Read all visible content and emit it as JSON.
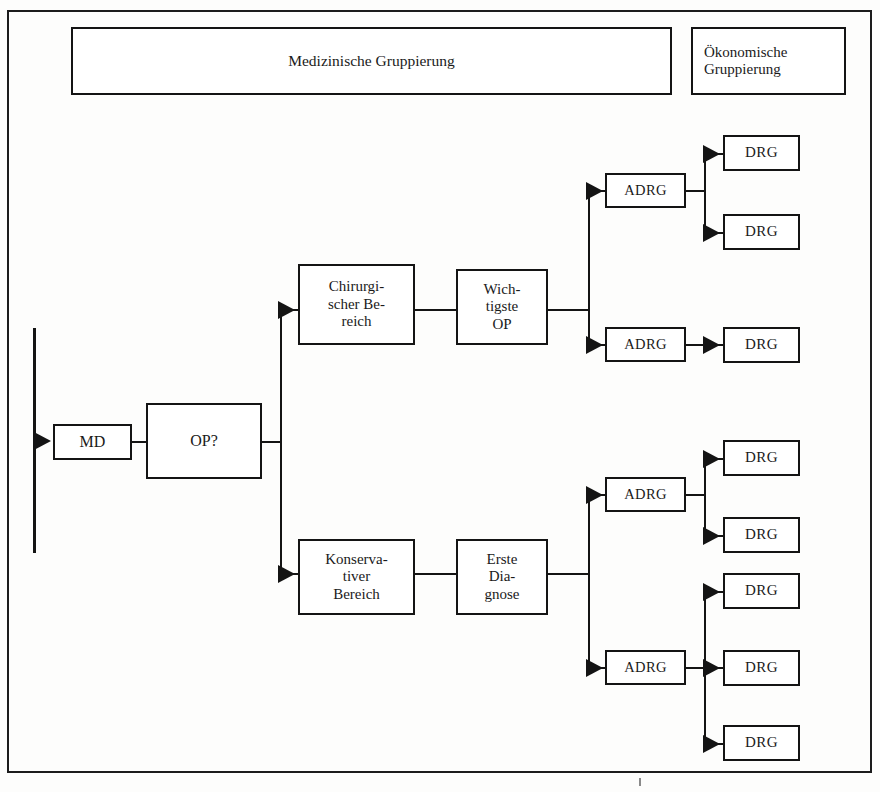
{
  "diagram": {
    "title_left": "Medizinische Gruppierung",
    "title_right": "Ökonomische\nGruppierung",
    "nodes": {
      "md": "MD",
      "op": "OP?",
      "surgical_area": "Chirurgi-\nscher Be-\nreich",
      "main_op": "Wich-\ntigste\nOP",
      "conservative_area": "Konserva-\ntiver\nBereich",
      "first_diagnosis": "Erste\nDia-\ngnose",
      "adrg_1": "ADRG",
      "adrg_2": "ADRG",
      "adrg_3": "ADRG",
      "adrg_4": "ADRG",
      "drg_1": "DRG",
      "drg_2": "DRG",
      "drg_3": "DRG",
      "drg_4": "DRG",
      "drg_5": "DRG",
      "drg_6": "DRG",
      "drg_7": "DRG",
      "drg_8": "DRG"
    },
    "colors": {
      "line": "#141414",
      "frame": "#1c1c1c",
      "background": "#fdfdfc"
    }
  }
}
